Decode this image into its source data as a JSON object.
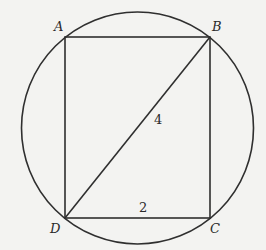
{
  "figure": {
    "vertices": {
      "A": {
        "label": "A",
        "x": 65,
        "y": 37
      },
      "B": {
        "label": "B",
        "x": 210,
        "y": 37
      },
      "C": {
        "label": "C",
        "x": 210,
        "y": 218
      },
      "D": {
        "label": "D",
        "x": 65,
        "y": 218
      }
    },
    "circle": {
      "cx": 137.5,
      "cy": 127.5,
      "r": 116
    },
    "segment_labels": {
      "diagonal_BD": "4",
      "side_DC": "2"
    },
    "colors": {
      "stroke": "#2f2f2f",
      "background": "#f3f3f1"
    }
  }
}
